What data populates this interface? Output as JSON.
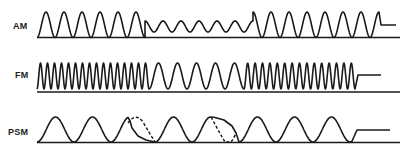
{
  "diagram": {
    "rows": [
      {
        "key": "am",
        "label": "AM",
        "description": "Amplitude modulation: carrier amplitude drops for a segment then returns, ends in a flat step"
      },
      {
        "key": "fm",
        "label": "FM",
        "description": "Frequency modulation: carrier frequency lowers for a segment then returns, ends in a flat step"
      },
      {
        "key": "psm",
        "label": "PSM",
        "description": "Phase shift modulation: two phase shifts shown with dashed (original) and solid (shifted) curves, ends in a flat step"
      }
    ],
    "colors": {
      "line": "#1a1a1a",
      "text": "#222222",
      "background": "#ffffff"
    }
  }
}
